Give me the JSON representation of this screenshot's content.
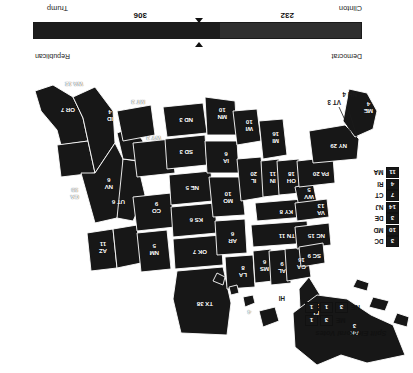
{
  "figure": {
    "orientation": "rotated-180"
  },
  "split_legend": {
    "title": "Split Electoral Votes",
    "rows": [
      {
        "state": "ME",
        "boxes": [
          "3",
          "1"
        ]
      },
      {
        "state": "NE",
        "boxes": [
          "3",
          "1",
          "1"
        ]
      }
    ]
  },
  "small_states_legend": {
    "items": [
      {
        "state": "MA",
        "votes": "11"
      },
      {
        "state": "RI",
        "votes": "4"
      },
      {
        "state": "CT",
        "votes": "7"
      },
      {
        "state": "NJ",
        "votes": "14"
      },
      {
        "state": "DE",
        "votes": "3"
      },
      {
        "state": "MD",
        "votes": "10"
      },
      {
        "state": "DC",
        "votes": "3"
      }
    ]
  },
  "map": {
    "state_labels": [
      {
        "id": "WA",
        "text": "WA 12"
      },
      {
        "id": "OR",
        "text": "OR 7"
      },
      {
        "id": "CA",
        "text": "CA",
        "votes": "55"
      },
      {
        "id": "NV",
        "text": "NV",
        "votes": "6"
      },
      {
        "id": "ID",
        "text": "ID",
        "votes": "4"
      },
      {
        "id": "MT",
        "text": "MT 3"
      },
      {
        "id": "WY",
        "text": "WY 3"
      },
      {
        "id": "UT",
        "text": "UT 6"
      },
      {
        "id": "AZ",
        "text": "AZ",
        "votes": "11"
      },
      {
        "id": "CO",
        "text": "CO",
        "votes": "9"
      },
      {
        "id": "NM",
        "text": "NM",
        "votes": "5"
      },
      {
        "id": "ND",
        "text": "ND 3"
      },
      {
        "id": "SD",
        "text": "SD 3"
      },
      {
        "id": "NE",
        "text": "NE 5"
      },
      {
        "id": "KS",
        "text": "KS 6"
      },
      {
        "id": "OK",
        "text": "OK 7"
      },
      {
        "id": "TX",
        "text": "TX 38"
      },
      {
        "id": "MN",
        "text": "MN",
        "votes": "10"
      },
      {
        "id": "IA",
        "text": "IA",
        "votes": "6"
      },
      {
        "id": "MO",
        "text": "MO",
        "votes": "10"
      },
      {
        "id": "AR",
        "text": "AR",
        "votes": "6"
      },
      {
        "id": "LA",
        "text": "LA",
        "votes": "8"
      },
      {
        "id": "WI",
        "text": "WI",
        "votes": "10"
      },
      {
        "id": "IL",
        "text": "IL",
        "votes": "20"
      },
      {
        "id": "MS",
        "text": "MS",
        "votes": "6"
      },
      {
        "id": "AL",
        "text": "AL",
        "votes": "9"
      },
      {
        "id": "MI",
        "text": "MI",
        "votes": "16"
      },
      {
        "id": "IN",
        "text": "IN",
        "votes": "11"
      },
      {
        "id": "KY",
        "text": "KY 8"
      },
      {
        "id": "TN",
        "text": "TN 11"
      },
      {
        "id": "GA",
        "text": "GA",
        "votes": "16"
      },
      {
        "id": "FL",
        "text": "FL",
        "votes": "29"
      },
      {
        "id": "OH",
        "text": "OH",
        "votes": "18"
      },
      {
        "id": "WV",
        "text": "WV",
        "votes": "5"
      },
      {
        "id": "VA",
        "text": "VA",
        "votes": "13"
      },
      {
        "id": "NC",
        "text": "NC 15"
      },
      {
        "id": "SC",
        "text": "SC 9"
      },
      {
        "id": "PA",
        "text": "PA 20"
      },
      {
        "id": "NY",
        "text": "NY 29"
      },
      {
        "id": "AK",
        "text": "AK",
        "votes": "3"
      },
      {
        "id": "HI",
        "text": "HI"
      }
    ],
    "outside_labels": [
      {
        "id": "ME",
        "text": "ME",
        "votes": "4"
      },
      {
        "id": "NH",
        "text": "NH 4"
      },
      {
        "id": "VT",
        "text": "VT 3"
      },
      {
        "id": "HI",
        "text": "HI"
      }
    ]
  },
  "tally": {
    "left_party": "Democrat",
    "left_candidate": "Clinton",
    "left_votes": "232",
    "right_party": "Republican",
    "right_candidate": "Trump",
    "right_votes": "306",
    "total": 538,
    "majority": 270
  },
  "colors": {
    "ink": "#171717",
    "paper": "#ffffff",
    "label": "#ffffff"
  }
}
